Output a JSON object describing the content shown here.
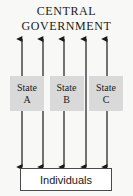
{
  "diagram": {
    "type": "federal-structure-diagram",
    "background_color": "#f8f8f6",
    "title": {
      "line_1": "CENTRAL",
      "line_2": "GOVERNMENT"
    },
    "states": [
      {
        "label": "State",
        "letter": "A"
      },
      {
        "label": "State",
        "letter": "B"
      },
      {
        "label": "State",
        "letter": "C"
      }
    ],
    "bottom_box": {
      "label": "Individuals"
    },
    "connectors": {
      "count": 5,
      "style": "double-headed-vertical-arrow",
      "color": "#1a1a1a",
      "description": "Five double-headed vertical arrows linking the central government to the individuals, passing between and through the state boxes"
    },
    "colors": {
      "state_box_fill": "#d9d9d9",
      "bottom_box_fill": "#ffffff",
      "bottom_box_border": "#4a4a4a",
      "text": "#1a1a1a",
      "arrow": "#1a1a1a"
    }
  }
}
